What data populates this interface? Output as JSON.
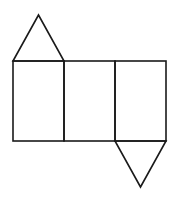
{
  "diagram": {
    "type": "net-of-triangular-prism",
    "stroke_color": "#1a1a1a",
    "background": "#ffffff",
    "rectangles": [
      {
        "x": 13,
        "y": 61,
        "w": 51,
        "h": 80
      },
      {
        "x": 64,
        "y": 61,
        "w": 51,
        "h": 80
      },
      {
        "x": 115,
        "y": 61,
        "w": 51,
        "h": 80
      }
    ],
    "triangles": [
      {
        "points": "13,61 38.5,15 64,61"
      },
      {
        "points": "115,141 166,141 140.5,187"
      }
    ]
  }
}
